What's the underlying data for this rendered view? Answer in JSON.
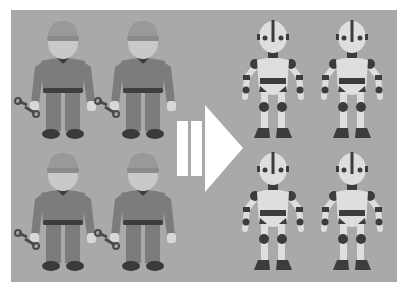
{
  "scene": {
    "description": "Illustration: four human mechanics holding wrenches transform into four robots, indicated by a large arrow",
    "background_color": "#a9a9a9",
    "page_color": "#ffffff",
    "colors": {
      "worker_body": "#7c7c7c",
      "worker_cap": "#999999",
      "worker_skin": "#c9c9c9",
      "worker_belt": "#3d3d3d",
      "worker_shoe": "#3a3a3a",
      "robot_light": "#dedede",
      "robot_dark": "#3c3c3c",
      "arrow": "#ffffff"
    },
    "left_group": {
      "label": "human mechanics",
      "items": [
        {
          "name": "worker-1",
          "cx": 63,
          "top": 21
        },
        {
          "name": "worker-2",
          "cx": 143,
          "top": 21
        },
        {
          "name": "worker-3",
          "cx": 63,
          "top": 153
        },
        {
          "name": "worker-4",
          "cx": 143,
          "top": 153
        }
      ]
    },
    "right_group": {
      "label": "robots",
      "items": [
        {
          "name": "robot-1",
          "cx": 273,
          "top": 21
        },
        {
          "name": "robot-2",
          "cx": 352,
          "top": 21
        },
        {
          "name": "robot-3",
          "cx": 273,
          "top": 152
        },
        {
          "name": "robot-4",
          "cx": 352,
          "top": 152
        }
      ]
    },
    "arrow": {
      "label": "transformation arrow"
    }
  }
}
